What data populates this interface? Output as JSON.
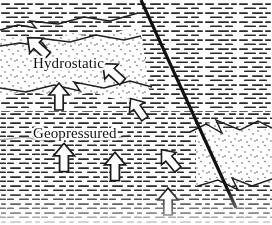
{
  "figure": {
    "type": "geological-cross-section",
    "width": 272,
    "height": 225,
    "background_color": "#ffffff",
    "ink_color": "#1a1a1a"
  },
  "labels": {
    "hydrostatic": "Hydrostatic",
    "geopressured": "Geopressured"
  },
  "lithology": {
    "shale": {
      "name": "shale",
      "pattern": "horizontal-dashes",
      "color": "#2b2b2b"
    },
    "sand": {
      "name": "sand",
      "pattern": "stipple-dots",
      "color": "#4a4a4a"
    }
  },
  "fault": {
    "name": "normal-fault",
    "stroke": "#111111",
    "stroke_width": 3.2,
    "x1": 141,
    "y1": 0,
    "x2": 236,
    "y2": 208
  },
  "arrows": [
    {
      "id": "arrow-1",
      "direction": "up-left",
      "x": 38,
      "y": 47,
      "angle": -48,
      "scale": 1.0
    },
    {
      "id": "arrow-2",
      "direction": "up-left",
      "x": 113,
      "y": 73,
      "angle": -48,
      "scale": 1.0
    },
    {
      "id": "arrow-3",
      "direction": "up",
      "x": 59,
      "y": 97,
      "angle": 0,
      "scale": 1.0
    },
    {
      "id": "arrow-4",
      "direction": "up-left",
      "x": 138,
      "y": 109,
      "angle": -35,
      "scale": 0.92
    },
    {
      "id": "arrow-5",
      "direction": "up",
      "x": 64,
      "y": 158,
      "angle": 0,
      "scale": 1.05
    },
    {
      "id": "arrow-6",
      "direction": "up",
      "x": 115,
      "y": 167,
      "angle": 0,
      "scale": 1.05
    },
    {
      "id": "arrow-7",
      "direction": "up-left",
      "x": 170,
      "y": 160,
      "angle": -40,
      "scale": 0.95
    },
    {
      "id": "arrow-8",
      "direction": "up",
      "x": 168,
      "y": 202,
      "angle": 0,
      "scale": 1.0
    }
  ],
  "sand_bodies": [
    {
      "id": "sand-upper-left",
      "description": "stippled sand wedge in hydrostatic zone, upper left"
    },
    {
      "id": "sand-lower-right",
      "description": "stippled sand body right of fault, lower right"
    }
  ],
  "bed_boundaries": [
    {
      "id": "bed-top-left",
      "description": "jagged bed contact upper left"
    },
    {
      "id": "bed-mid-left",
      "description": "jagged bed contact mid left under hydrostatic"
    },
    {
      "id": "bed-right-upper",
      "description": "jagged bed contact top of lower-right sand"
    },
    {
      "id": "bed-right-lower",
      "description": "jagged bed contact base of lower-right sand"
    }
  ]
}
